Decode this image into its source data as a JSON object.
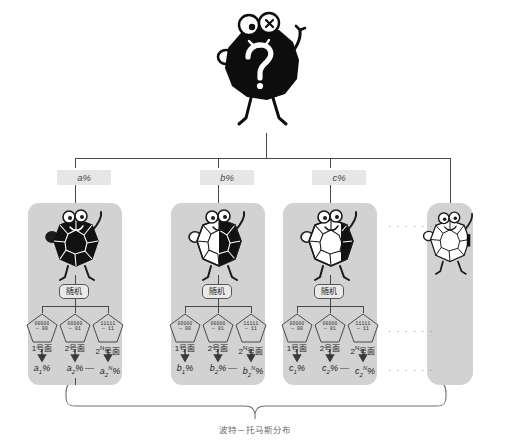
{
  "diagram": {
    "caption": "波特－托马斯分布",
    "root": {
      "icon": "question-mark-creature",
      "symbol": "?"
    },
    "branch_labels": [
      {
        "text": "a%"
      },
      {
        "text": "b%"
      },
      {
        "text": "c%"
      },
      {
        "text": ""
      }
    ],
    "ellipsis": {
      "top": "· · ·   · · ·",
      "middle": "· · ·   · · ·",
      "bottom": "· · ·   · · ·"
    },
    "panels": [
      {
        "id": "panel-a",
        "creature": "black-polyhedron-creature",
        "random_label": "随机",
        "pentagons": [
          {
            "top": "00000",
            "bottom": "— 00"
          },
          {
            "top": "00000",
            "bottom": "— 01"
          },
          {
            "top": "11111",
            "bottom": "— 11"
          }
        ],
        "face_labels": [
          "1号面",
          "2号面",
          "2ᴺ号面"
        ],
        "face_last_base": "2",
        "face_last_exp": "N",
        "face_last_suffix": "号面",
        "percents": [
          "a₁%",
          "a₂%",
          "a₂ᴺ%"
        ],
        "percent_parts": [
          {
            "base": "a",
            "sub": "1",
            "sup": "",
            "tail": "%"
          },
          {
            "base": "a",
            "sub": "2",
            "sup": "",
            "tail": "%"
          },
          {
            "base": "a",
            "sub": "2",
            "sup": "N",
            "tail": "%"
          }
        ],
        "separator": "—"
      },
      {
        "id": "panel-b",
        "creature": "half-black-polyhedron-creature",
        "random_label": "随机",
        "pentagons": [
          {
            "top": "00000",
            "bottom": "— 00"
          },
          {
            "top": "00000",
            "bottom": "— 01"
          },
          {
            "top": "11111",
            "bottom": "— 11"
          }
        ],
        "face_labels": [
          "1号面",
          "2号面",
          "2ᴺ号面"
        ],
        "face_last_base": "2",
        "face_last_exp": "N",
        "face_last_suffix": "号面",
        "percents": [
          "b₁%",
          "b₂%",
          "b₂ᴺ%"
        ],
        "percent_parts": [
          {
            "base": "b",
            "sub": "1",
            "sup": "",
            "tail": "%"
          },
          {
            "base": "b",
            "sub": "2",
            "sup": "",
            "tail": "%"
          },
          {
            "base": "b",
            "sub": "2",
            "sup": "N",
            "tail": "%"
          }
        ],
        "separator": "—"
      },
      {
        "id": "panel-c",
        "creature": "mostly-white-polyhedron-creature",
        "random_label": "随机",
        "pentagons": [
          {
            "top": "00000",
            "bottom": "— 00"
          },
          {
            "top": "00000",
            "bottom": "— 01"
          },
          {
            "top": "11111",
            "bottom": "— 11"
          }
        ],
        "face_labels": [
          "1号面",
          "2号面",
          "2ᴺ号面"
        ],
        "face_last_base": "2",
        "face_last_exp": "N",
        "face_last_suffix": "号面",
        "percents": [
          "c₁%",
          "c₂%",
          "c₂ᴺ%"
        ],
        "percent_parts": [
          {
            "base": "c",
            "sub": "1",
            "sup": "",
            "tail": "%"
          },
          {
            "base": "c",
            "sub": "2",
            "sup": "",
            "tail": "%"
          },
          {
            "base": "c",
            "sub": "2",
            "sup": "N",
            "tail": "%"
          }
        ],
        "separator": "—"
      },
      {
        "id": "panel-more",
        "creature": "white-polyhedron-creature",
        "random_label": "",
        "pentagons": [],
        "face_labels": [],
        "percents": [],
        "separator": ""
      }
    ]
  },
  "colors": {
    "panel_fill": "#d2d2d2",
    "chip_fill": "#e6e6e6",
    "line": "#4a4a4a",
    "ink": "#1f1f1f",
    "caption": "#6b6b6b",
    "ellipsis": "#8d8d8d",
    "creature_black": "#0d0d0d",
    "creature_white": "#ffffff"
  }
}
